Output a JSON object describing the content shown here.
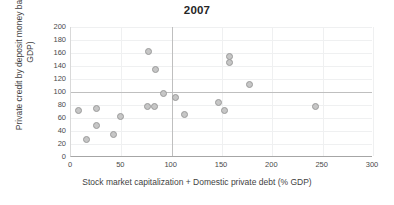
{
  "chart_data": {
    "type": "scatter",
    "title": "2007",
    "xlabel": "Stock market capitalization + Domestic private debt (% GDP)",
    "ylabel": "Private credit by deposit money banks (% GDP)",
    "xlim": [
      0,
      300
    ],
    "ylim": [
      0,
      200
    ],
    "xticks": [
      0,
      50,
      100,
      150,
      200,
      250,
      300
    ],
    "yticks": [
      0,
      20,
      40,
      60,
      80,
      100,
      120,
      140,
      160,
      180,
      200
    ],
    "grid": true,
    "legend": null,
    "reference_lines": {
      "horizontal": [
        100
      ],
      "vertical": [
        100
      ]
    },
    "marker": {
      "shape": "circle",
      "fill_color": "#c6c6c6",
      "edge_color": "#9b9b9b",
      "size_px": 7
    },
    "points": [
      {
        "x": 7,
        "y": 71
      },
      {
        "x": 15,
        "y": 27
      },
      {
        "x": 25,
        "y": 74
      },
      {
        "x": 25,
        "y": 49
      },
      {
        "x": 42,
        "y": 34
      },
      {
        "x": 49,
        "y": 62
      },
      {
        "x": 76,
        "y": 78
      },
      {
        "x": 77,
        "y": 163
      },
      {
        "x": 83,
        "y": 77
      },
      {
        "x": 84,
        "y": 134
      },
      {
        "x": 92,
        "y": 97
      },
      {
        "x": 104,
        "y": 91
      },
      {
        "x": 113,
        "y": 65
      },
      {
        "x": 147,
        "y": 84
      },
      {
        "x": 152,
        "y": 72
      },
      {
        "x": 157,
        "y": 154
      },
      {
        "x": 157,
        "y": 146
      },
      {
        "x": 177,
        "y": 111
      },
      {
        "x": 243,
        "y": 77
      }
    ]
  },
  "colors": {
    "title": "#262626",
    "tick_label": "#4a4a4a",
    "axis_title": "#3f3f3f",
    "gridline": "#eff0f1",
    "reference_line": "#bfbfbf",
    "axis_line": "#a6a6a6",
    "background": "#ffffff"
  }
}
